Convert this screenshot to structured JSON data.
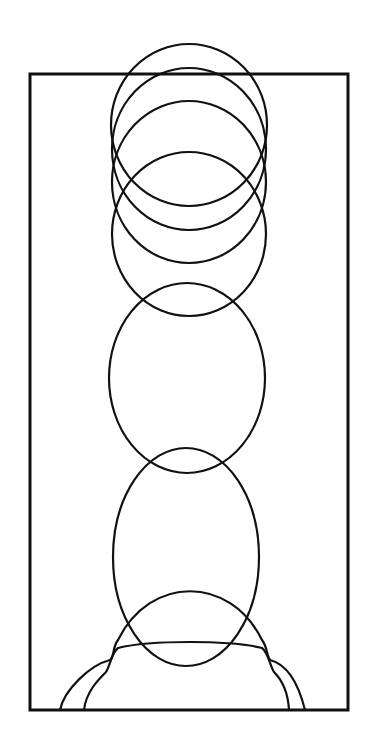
{
  "diagram": {
    "width": 377,
    "height": 753,
    "stroke_color": "#111111",
    "background": "#ffffff",
    "frame": {
      "x": 30,
      "y": 74,
      "width": 318,
      "height": 636,
      "stroke_width": 3
    },
    "ellipses": [
      {
        "id": "circle-1",
        "cx": 189,
        "cy": 125,
        "rx": 78,
        "ry": 81
      },
      {
        "id": "circle-2",
        "cx": 189,
        "cy": 149,
        "rx": 77,
        "ry": 81
      },
      {
        "id": "circle-3",
        "cx": 189,
        "cy": 182,
        "rx": 77,
        "ry": 81
      },
      {
        "id": "circle-4",
        "cx": 189,
        "cy": 234,
        "rx": 77,
        "ry": 82
      },
      {
        "id": "ellipse-5",
        "cx": 187,
        "cy": 378,
        "rx": 78,
        "ry": 95
      },
      {
        "id": "ellipse-6",
        "cx": 186,
        "cy": 557,
        "rx": 73,
        "ry": 109
      }
    ],
    "bottom_arcs": [
      {
        "id": "arc-outer",
        "d": "M 60 710 C 64 690, 90 665, 110 660 C 115 655, 112 648, 118 640 C 150 575, 230 575, 262 640 C 268 648, 266 655, 270 660 C 290 665, 300 690, 305 710"
      },
      {
        "id": "arc-inner",
        "d": "M 84 710 C 86 692, 98 680, 106 672 C 110 666, 112 652, 118 648 C 150 640, 230 640, 262 648 C 268 652, 270 666, 274 672 C 282 680, 288 692, 289 710"
      }
    ]
  }
}
